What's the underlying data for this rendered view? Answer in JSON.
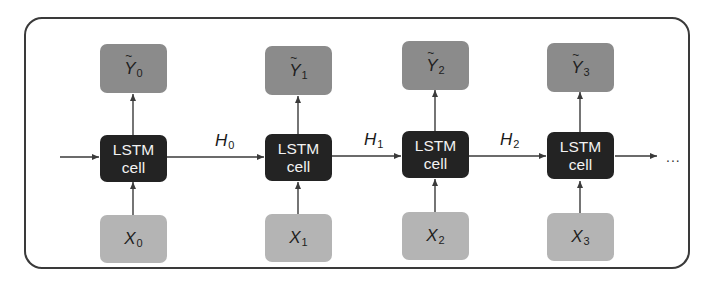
{
  "diagram": {
    "cells": [
      {
        "label_line1": "LSTM",
        "label_line2": "cell",
        "input": {
          "symbol": "X",
          "subscript": "0"
        },
        "output": {
          "symbol": "Y",
          "subscript": "0",
          "accent": "~"
        }
      },
      {
        "label_line1": "LSTM",
        "label_line2": "cell",
        "input": {
          "symbol": "X",
          "subscript": "1"
        },
        "output": {
          "symbol": "Y",
          "subscript": "1",
          "accent": "~"
        }
      },
      {
        "label_line1": "LSTM",
        "label_line2": "cell",
        "input": {
          "symbol": "X",
          "subscript": "2"
        },
        "output": {
          "symbol": "Y",
          "subscript": "2",
          "accent": "~"
        }
      },
      {
        "label_line1": "LSTM",
        "label_line2": "cell",
        "input": {
          "symbol": "X",
          "subscript": "3"
        },
        "output": {
          "symbol": "Y",
          "subscript": "3",
          "accent": "~"
        }
      }
    ],
    "hidden_states": [
      {
        "symbol": "H",
        "subscript": "0"
      },
      {
        "symbol": "H",
        "subscript": "1"
      },
      {
        "symbol": "H",
        "subscript": "2"
      }
    ],
    "continuation": "...",
    "colors": {
      "output_box": "#8b8b8b",
      "cell_box": "#232323",
      "input_box": "#b4b4b4",
      "cell_text": "#f2f2f2",
      "frame": "#3a3a3a",
      "arrow": "#3a3a3a"
    }
  }
}
